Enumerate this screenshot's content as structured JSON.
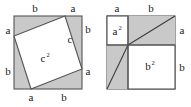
{
  "figure": {
    "colors": {
      "shade": "#c9c9c9",
      "fill_white": "#ffffff",
      "stroke": "#555555",
      "stroke_dark": "#3c3c3c",
      "text": "#1a1a1a",
      "background": "#ffffff"
    },
    "left_diagram": {
      "name": "tilted-square-c-squared",
      "inner_area_label": "c",
      "inner_area_exponent": "2",
      "hypotenuse_label": "c",
      "edge_labels": {
        "top_left": "b",
        "top_right": "a",
        "left_top": "a",
        "left_bottom": "b",
        "right_top": "b",
        "right_bottom": "a",
        "bottom_left": "a",
        "bottom_right": "b"
      }
    },
    "right_diagram": {
      "name": "two-squares-a-squared-b-squared",
      "small_square_label": "a",
      "small_square_exponent": "2",
      "large_square_label": "b",
      "large_square_exponent": "2",
      "edge_labels": {
        "top_left": "a",
        "top_right": "b",
        "right_top": "a",
        "right_bottom": "b"
      }
    }
  }
}
